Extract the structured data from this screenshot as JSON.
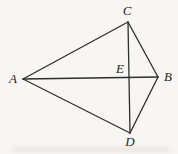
{
  "figure": {
    "kind": "geometry-diagram",
    "style": {
      "line_color": "#2e2e2e",
      "line_width": 1.3,
      "label_color": "#1e1e1e",
      "background": "#f7f6f3"
    },
    "points": {
      "A": {
        "x": 23,
        "y": 79
      },
      "B": {
        "x": 158,
        "y": 77
      },
      "C": {
        "x": 128,
        "y": 22
      },
      "D": {
        "x": 130,
        "y": 133
      },
      "E": {
        "x": 128,
        "y": 78
      }
    },
    "segments": [
      [
        "A",
        "C"
      ],
      [
        "A",
        "B"
      ],
      [
        "A",
        "D"
      ],
      [
        "C",
        "B"
      ],
      [
        "D",
        "B"
      ],
      [
        "C",
        "D"
      ]
    ],
    "labels": [
      {
        "text": "A",
        "x": 13,
        "y": 83,
        "anchor": "middle"
      },
      {
        "text": "B",
        "x": 168,
        "y": 81,
        "anchor": "middle"
      },
      {
        "text": "C",
        "x": 127,
        "y": 15,
        "anchor": "middle"
      },
      {
        "text": "D",
        "x": 130,
        "y": 146,
        "anchor": "middle"
      },
      {
        "text": "E",
        "x": 120,
        "y": 73,
        "anchor": "middle"
      }
    ]
  }
}
